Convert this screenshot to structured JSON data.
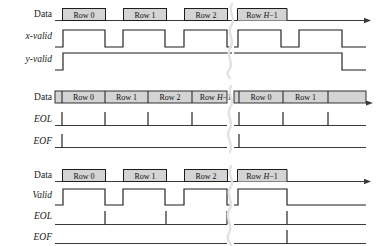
{
  "figure": {
    "background_color": "#ffffff",
    "ink_color": "#1d1d1d",
    "box_fill_color": "#d4d4d4",
    "break_color": "#e2e2e2"
  },
  "panels": [
    {
      "id": "panel-xy-valid",
      "signals": [
        {
          "name": "Data",
          "label": "Data",
          "italic": false,
          "type": "databus"
        },
        {
          "name": "x-valid",
          "label": "x-valid",
          "italic": true,
          "type": "level"
        },
        {
          "name": "y-valid",
          "label": "y-valid",
          "italic": true,
          "type": "level"
        }
      ],
      "data_boxes": [
        {
          "label": "Row 0",
          "label_prefix": "Row ",
          "label_italic": "",
          "label_suffix": "0",
          "open_right": false
        },
        {
          "label": "Row 1",
          "label_prefix": "Row ",
          "label_italic": "",
          "label_suffix": "1",
          "open_right": false
        },
        {
          "label": "Row 2",
          "label_prefix": "Row ",
          "label_italic": "",
          "label_suffix": "2",
          "open_right": false
        },
        {
          "label": "Row H-1",
          "label_prefix": "Row ",
          "label_italic": "H",
          "label_suffix": "−1",
          "open_right": true
        }
      ]
    },
    {
      "id": "panel-eol-eof-continuous",
      "signals": [
        {
          "name": "Data",
          "label": "Data",
          "italic": false,
          "type": "databus-continuous"
        },
        {
          "name": "EOL",
          "label": "EOL",
          "italic": true,
          "type": "pulse"
        },
        {
          "name": "EOF",
          "label": "EOF",
          "italic": true,
          "type": "pulse"
        }
      ],
      "data_boxes": [
        {
          "label": "Row 0",
          "label_prefix": "Row ",
          "label_italic": "",
          "label_suffix": "0"
        },
        {
          "label": "Row 1",
          "label_prefix": "Row ",
          "label_italic": "",
          "label_suffix": "1"
        },
        {
          "label": "Row 2",
          "label_prefix": "Row ",
          "label_italic": "",
          "label_suffix": "2"
        },
        {
          "label": "Row H-1",
          "label_prefix": "Row ",
          "label_italic": "H",
          "label_suffix": "−1"
        },
        {
          "label": "Row 0",
          "label_prefix": "Row ",
          "label_italic": "",
          "label_suffix": "0"
        },
        {
          "label": "Row 1",
          "label_prefix": "Row ",
          "label_italic": "",
          "label_suffix": "1"
        }
      ]
    },
    {
      "id": "panel-valid-eol-eof",
      "signals": [
        {
          "name": "Data",
          "label": "Data",
          "italic": false,
          "type": "databus"
        },
        {
          "name": "Valid",
          "label": "Valid",
          "italic": true,
          "type": "level"
        },
        {
          "name": "EOL",
          "label": "EOL",
          "italic": true,
          "type": "pulse"
        },
        {
          "name": "EOF",
          "label": "EOF",
          "italic": true,
          "type": "pulse"
        }
      ],
      "data_boxes": [
        {
          "label": "Row 0",
          "label_prefix": "Row ",
          "label_italic": "",
          "label_suffix": "0",
          "open_right": false
        },
        {
          "label": "Row 1",
          "label_prefix": "Row ",
          "label_italic": "",
          "label_suffix": "1",
          "open_right": false
        },
        {
          "label": "Row 2",
          "label_prefix": "Row ",
          "label_italic": "",
          "label_suffix": "2",
          "open_right": false
        },
        {
          "label": "Row H-1",
          "label_prefix": "Row ",
          "label_italic": "H",
          "label_suffix": "−1",
          "open_right": true
        }
      ]
    }
  ],
  "annotations": {
    "time_break_symbol": "squiggle-break",
    "time_axis_arrow": "right-arrow"
  }
}
